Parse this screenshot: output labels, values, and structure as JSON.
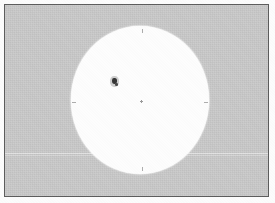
{
  "image": {
    "title": "Sunspot drawing plate",
    "width": 275,
    "height": 203,
    "caption": ""
  },
  "frame": {
    "border_color": "#5c5c5c",
    "background_color": "#c9c9c9",
    "paper_color": "#fcfcfc"
  },
  "solar_disk": {
    "label": "solar disk",
    "fill_color": "#fdfdfd",
    "center_x": 135,
    "center_y": 95,
    "radius_x": 69,
    "radius_y": 74
  },
  "features": [
    {
      "name": "sunspot-group",
      "label": "sunspot group",
      "color": "#353535",
      "x": 110,
      "y": 78
    },
    {
      "name": "disk-center-mark",
      "label": "disk center",
      "color": "#9a9a9a",
      "x": 136,
      "y": 96
    }
  ],
  "limb_ticks": [
    {
      "name": "north-tick",
      "label": "N"
    },
    {
      "name": "south-tick",
      "label": "S"
    },
    {
      "name": "east-tick",
      "label": "E"
    },
    {
      "name": "west-tick",
      "label": "W"
    }
  ],
  "artifacts": {
    "scan_line_label": "horizontal scan artifact"
  }
}
